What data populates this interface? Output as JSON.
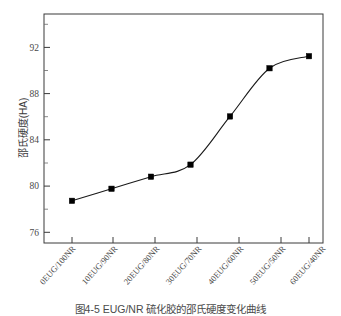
{
  "figure": {
    "caption": "图4-5 EUG/NR 硫化胶的邵氏硬度变化曲线"
  },
  "chart_data": {
    "type": "line",
    "title": "",
    "xlabel": "",
    "ylabel": "邵氏硬度(HA)",
    "categories": [
      "0EUG/100NR",
      "10EUG/90NR",
      "20EUG/80NR",
      "30EUG/70NR",
      "40EUG/60NR",
      "50EUG/50NR",
      "60EUG/40NR"
    ],
    "values": [
      78,
      79,
      80,
      81,
      85,
      89,
      90
    ],
    "ylim": [
      74.5,
      93.5
    ],
    "yticks": [
      76,
      80,
      84,
      88,
      92
    ],
    "ytick_labels": [
      "76",
      "80",
      "84",
      "88",
      "92"
    ],
    "minor_ticks": true,
    "grid": false,
    "legend": false,
    "marker": "filled-square",
    "marker_color": "#000000",
    "line_color": "#1a1a1a",
    "line_style": "smooth-solid",
    "frame": "box"
  }
}
